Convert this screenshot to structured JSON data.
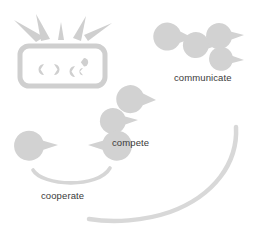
{
  "diagram": {
    "type": "conceptual-illustration",
    "background_color": "#ffffff",
    "shape_color": "#d3d3d3",
    "outline_color": "#cccccc",
    "text_color": "#3a3a3a",
    "canvas": {
      "width": 269,
      "height": 228
    },
    "labels": [
      {
        "id": "communicate",
        "text": "communicate",
        "x": 174,
        "y": 72
      },
      {
        "id": "compete",
        "text": "compete",
        "x": 112,
        "y": 137
      },
      {
        "id": "cooperate",
        "text": "cooperate",
        "x": 41,
        "y": 190
      }
    ],
    "groups": [
      {
        "id": "communicate",
        "label": "communicate",
        "agent_count": 4,
        "agents": [
          {
            "cx": 193,
            "cy": 38,
            "r": 14,
            "mouth_deg": 200
          },
          {
            "cx": 221,
            "cy": 44,
            "r": 13,
            "mouth_deg": 185
          },
          {
            "cx": 244,
            "cy": 35,
            "r": 13,
            "mouth_deg": 175
          },
          {
            "cx": 244,
            "cy": 60,
            "r": 12,
            "mouth_deg": 195
          }
        ]
      },
      {
        "id": "compete",
        "label": "compete",
        "agent_count": 2,
        "agents": [
          {
            "cx": 156,
            "cy": 100,
            "r": 14,
            "mouth_deg": 205
          },
          {
            "cx": 138,
            "cy": 120,
            "r": 13,
            "mouth_deg": 185
          }
        ]
      },
      {
        "id": "cooperate",
        "label": "cooperate",
        "agent_count": 2,
        "agents": [
          {
            "cx": 58,
            "cy": 145,
            "r": 15,
            "mouth_deg": 180
          },
          {
            "cx": 88,
            "cy": 145,
            "r": 15,
            "mouth_deg": 0
          }
        ],
        "has_smile": true
      }
    ],
    "screen": {
      "id": "broadcast-screen",
      "x": 20,
      "y": 46,
      "width": 85,
      "height": 40,
      "radius": 9,
      "ray_count": 4,
      "inner_agent_count": 5
    },
    "big_smile": {
      "id": "background-smile-arc",
      "description": "large sweeping arc forming the mouth of the overall face"
    }
  }
}
